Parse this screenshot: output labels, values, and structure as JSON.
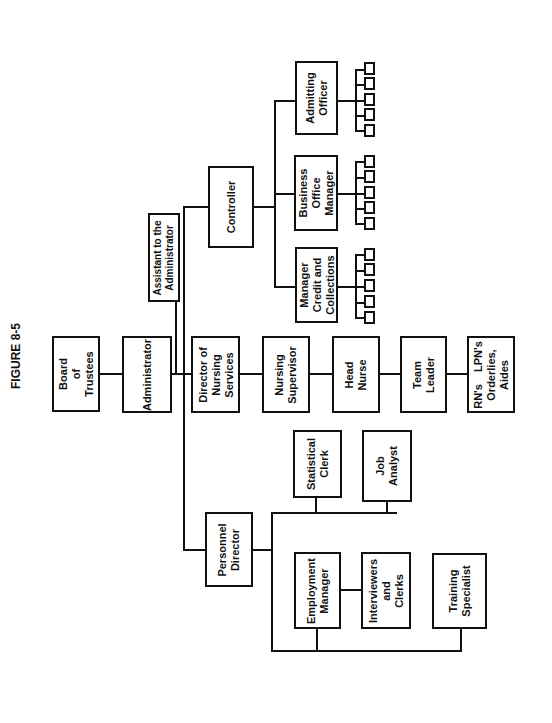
{
  "figure_label": "FIGURE 8-5",
  "orientation": "rotated 90 degrees counter-clockwise",
  "nodes": {
    "board": "Board\nof\nTrustees",
    "administrator": "Administrator",
    "assistant": "Assistant to the\nAdministrator",
    "nursing_director": "Director of\nNursing\nServices",
    "controller": "Controller",
    "credit_manager": "Manager\nCredit and\nCollections",
    "business_office": "Business\nOffice\nManager",
    "admitting": "Admitting\nOfficer",
    "nursing_supervisor": "Nursing\nSupervisor",
    "head_nurse": "Head\nNurse",
    "team_leader": "Team\nLeader",
    "staff": "RN's    LPN's\nOrderlies,\nAides",
    "personnel_director": "Personnel\nDirector",
    "statistical_clerk": "Statistical\nClerk",
    "job_analyst": "Job\nAnalyst",
    "employment_manager": "Employment\nManager",
    "interviewers": "Interviewers\nand\nClerks",
    "training": "Training\nSpecialist"
  },
  "subordinate_boxes_per_manager": 5,
  "hierarchy": {
    "Board of Trustees": [
      "Administrator"
    ],
    "Administrator": [
      "Assistant to the Administrator",
      "Controller",
      "Director of Nursing Services",
      "Personnel Director"
    ],
    "Controller": [
      "Manager Credit and Collections",
      "Business Office Manager",
      "Admitting Officer"
    ],
    "Director of Nursing Services": [
      "Nursing Supervisor"
    ],
    "Nursing Supervisor": [
      "Head Nurse"
    ],
    "Head Nurse": [
      "Team Leader"
    ],
    "Team Leader": [
      "RN's LPN's Orderlies, Aides"
    ],
    "Personnel Director": [
      "Statistical Clerk",
      "Job Analyst",
      "Employment Manager",
      "Training Specialist"
    ],
    "Employment Manager": [
      "Interviewers and Clerks"
    ]
  },
  "colors": {
    "line": "#111111",
    "background": "#ffffff"
  }
}
